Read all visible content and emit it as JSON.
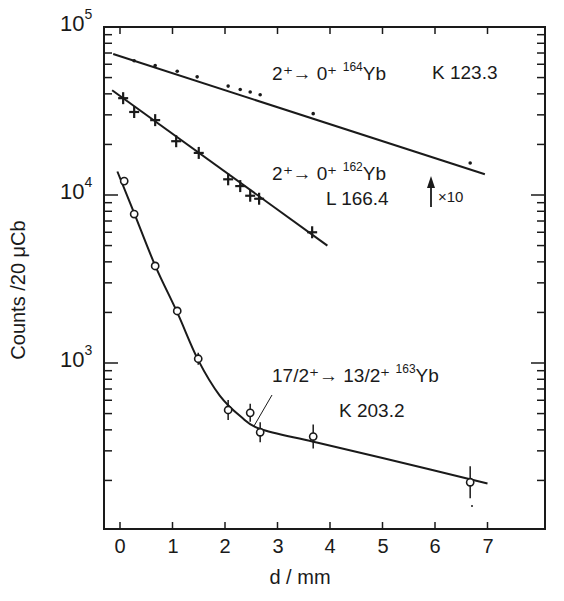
{
  "chart_data": {
    "type": "scatter",
    "title": "",
    "xlabel": "d/mm",
    "ylabel": "Counts /20 μCb",
    "xlim": [
      -0.3,
      8.0
    ],
    "ylim": [
      105,
      100000
    ],
    "yscale": "log",
    "grid": false,
    "x_ticks": [
      "0",
      "1",
      "2",
      "3",
      "4",
      "5",
      "6",
      "7"
    ],
    "y_ticks": [
      {
        "base": "10",
        "exp": "5",
        "value": 100000
      },
      {
        "base": "10",
        "exp": "4",
        "value": 10000
      },
      {
        "base": "10",
        "exp": "3",
        "value": 1000
      }
    ],
    "series": [
      {
        "name": "2+ → 0+ 164Yb K 123.3",
        "marker": "dot",
        "x": [
          0.27,
          0.67,
          1.09,
          1.47,
          2.06,
          2.29,
          2.48,
          2.67,
          3.68,
          6.67
        ],
        "y": [
          63000,
          59000,
          54500,
          50500,
          44500,
          42500,
          41000,
          39500,
          30500,
          15500
        ],
        "fit_line": {
          "x": [
            -0.13,
            6.95
          ],
          "y": [
            69000,
            13300
          ]
        }
      },
      {
        "name": "2+ → 0+ 162Yb L 166.4 (×10)",
        "marker": "cross",
        "x": [
          0.06,
          0.27,
          0.67,
          1.07,
          1.5,
          2.06,
          2.29,
          2.48,
          2.65,
          3.66
        ],
        "y": [
          37700,
          31200,
          27900,
          20900,
          17800,
          12400,
          11300,
          9900,
          9500,
          6000
        ],
        "fit_line": {
          "x": [
            -0.15,
            3.95
          ],
          "y": [
            42000,
            5000
          ]
        }
      },
      {
        "name": "17/2+ → 13/2+ 163Yb K 203.2",
        "marker": "open-circle",
        "x": [
          0.08,
          0.27,
          0.67,
          1.09,
          1.49,
          2.06,
          2.48,
          2.67,
          3.68,
          6.67
        ],
        "y": [
          12100,
          7700,
          3780,
          2040,
          1060,
          525,
          505,
          387,
          365,
          195
        ],
        "error_bars": true,
        "fit_curve": true
      }
    ],
    "annotations": [
      {
        "text": "2⁺→ 0⁺ ¹⁶⁴Yb  K 123.3"
      },
      {
        "text": "2⁺→ 0⁺ ¹⁶²Yb"
      },
      {
        "text": "L 166.4"
      },
      {
        "text": "↑ ×10"
      },
      {
        "text": "17/2⁺→ 13/2⁺ ¹⁶³Yb"
      },
      {
        "text": "K 203.2"
      }
    ]
  },
  "labels": {
    "ylabel": "Counts /20 μCb",
    "xlabel": "d / mm",
    "x_ticks": [
      "0",
      "1",
      "2",
      "3",
      "4",
      "5",
      "6",
      "7"
    ],
    "y_base": "10",
    "y_exp5": "5",
    "y_exp4": "4",
    "y_exp3": "3",
    "s1_prefix": "2⁺→ 0⁺ ",
    "s1_mass": "164",
    "s1_el": "Yb",
    "s1_line": "K 123.3",
    "s2_prefix": "2⁺→ 0⁺ ",
    "s2_mass": "162",
    "s2_el": "Yb",
    "s2_line": "L 166.4",
    "scale_note": "×10",
    "s3_prefix": "17/2⁺→ 13/2⁺ ",
    "s3_mass": "163",
    "s3_el": "Yb",
    "s3_line": "K 203.2"
  }
}
